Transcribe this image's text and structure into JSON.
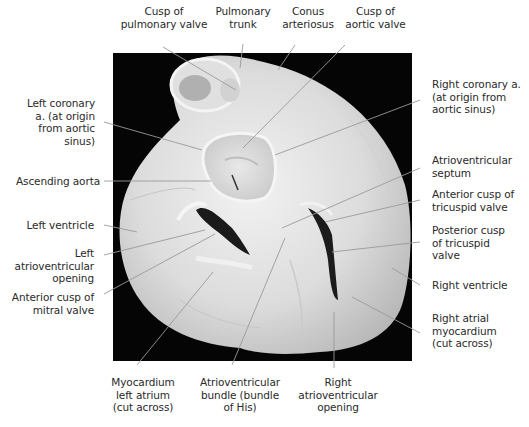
{
  "figure": {
    "photo_bounds": {
      "x": 113,
      "y": 53,
      "width": 299,
      "height": 308
    },
    "leader_color": "#9a9a9a"
  },
  "labels": {
    "top": [
      {
        "id": "cusp-pulmonary-valve",
        "text": "Cusp of\npulmonary valve"
      },
      {
        "id": "pulmonary-trunk",
        "text": "Pulmonary\ntrunk"
      },
      {
        "id": "conus-arteriosus",
        "text": "Conus\narteriosus"
      },
      {
        "id": "cusp-aortic-valve",
        "text": "Cusp of\naortic valve"
      }
    ],
    "left": [
      {
        "id": "left-coronary-artery",
        "text": "Left coronary\na. (at origin\nfrom aortic\nsinus)"
      },
      {
        "id": "ascending-aorta",
        "text": "Ascending aorta"
      },
      {
        "id": "left-ventricle",
        "text": "Left ventricle"
      },
      {
        "id": "left-av-opening",
        "text": "Left\natrioventricular\nopening"
      },
      {
        "id": "anterior-cusp-mitral",
        "text": "Anterior cusp of\nmitral valve"
      }
    ],
    "right": [
      {
        "id": "right-coronary-artery",
        "text": "Right coronary a.\n(at origin from\naortic sinus)"
      },
      {
        "id": "av-septum",
        "text": "Atrioventricular\nseptum"
      },
      {
        "id": "anterior-cusp-tricuspid",
        "text": "Anterior cusp of\ntricuspid valve"
      },
      {
        "id": "posterior-cusp-tricuspid",
        "text": "Posterior cusp\nof tricuspid\nvalve"
      },
      {
        "id": "right-ventricle",
        "text": "Right ventricle"
      },
      {
        "id": "right-atrial-myocardium",
        "text": "Right atrial\nmyocardium\n(cut across)"
      }
    ],
    "bottom": [
      {
        "id": "myocardium-left-atrium",
        "text": "Myocardium\nleft atrium\n(cut across)"
      },
      {
        "id": "av-bundle-his",
        "text": "Atrioventricular\nbundle (bundle\nof His)"
      },
      {
        "id": "right-av-opening",
        "text": "Right\natrioventricular\nopening"
      }
    ]
  }
}
